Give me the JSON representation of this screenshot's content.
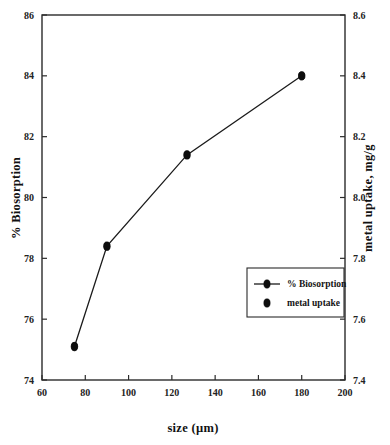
{
  "chart_data": {
    "type": "line",
    "title": "",
    "subtitle": "",
    "xlabel": "size (µm)",
    "ylabel": "% Biosorption",
    "y2label": "metal uptake, mg/g",
    "xlim": [
      60,
      200
    ],
    "ylim": [
      74,
      86
    ],
    "y2lim": [
      7.4,
      8.6
    ],
    "xticks": [
      60,
      80,
      100,
      120,
      140,
      160,
      180,
      200
    ],
    "xtick_labels": [
      "60",
      "80",
      "100",
      "120",
      "140",
      "160",
      "180",
      "200"
    ],
    "yticks": [
      74,
      76,
      78,
      80,
      82,
      84,
      86
    ],
    "ytick_labels": [
      "74",
      "76",
      "78",
      "80",
      "82",
      "84",
      "86"
    ],
    "y2ticks": [
      7.4,
      7.6,
      7.8,
      8.0,
      8.2,
      8.4,
      8.6
    ],
    "y2tick_labels": [
      "7.4",
      "7.6",
      "7.8",
      "8.0",
      "8.2",
      "8.4",
      "8.6"
    ],
    "grid": false,
    "legend_position": "lower-right",
    "x": [
      75,
      90,
      127,
      180
    ],
    "series": [
      {
        "name": "% Biosorption",
        "axis": "left",
        "marker": "circle",
        "has_line": true,
        "values": [
          75.1,
          78.4,
          81.4,
          84.0
        ]
      },
      {
        "name": "metal uptake",
        "axis": "right",
        "marker": "circle",
        "has_line": false,
        "values": [
          7.51,
          7.84,
          8.14,
          8.4
        ]
      }
    ],
    "annotations": []
  },
  "legend": {
    "entries": [
      {
        "label": "% Biosorption",
        "marker": "circle",
        "has_line": true
      },
      {
        "label": "metal uptake",
        "marker": "circle",
        "has_line": false
      }
    ]
  },
  "colors": {
    "line": "#1b1b1b",
    "marker": "#0d0d0d",
    "axis": "#2b2b2b",
    "text": "#151515",
    "background": "#ffffff"
  }
}
